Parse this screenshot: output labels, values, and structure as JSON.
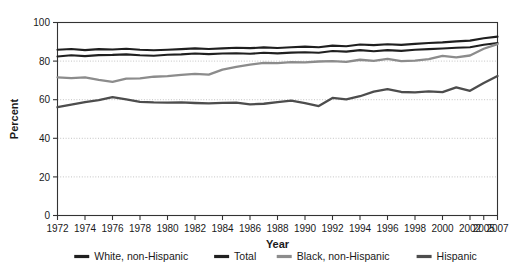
{
  "chart_data": {
    "type": "line",
    "title": "",
    "xlabel": "Year",
    "ylabel": "Percent",
    "ylim": [
      0,
      100
    ],
    "ytick_values": [
      0,
      20,
      40,
      60,
      80,
      100
    ],
    "ytick_labels": [
      "0",
      "20",
      "40",
      "60",
      "80",
      "100"
    ],
    "grid": "horizontal-dotted",
    "legend_position": "bottom",
    "x": [
      1972,
      1973,
      1974,
      1975,
      1976,
      1977,
      1978,
      1979,
      1980,
      1981,
      1982,
      1983,
      1984,
      1985,
      1986,
      1987,
      1988,
      1989,
      1990,
      1991,
      1992,
      1993,
      1994,
      1995,
      1996,
      1997,
      1998,
      1999,
      2000,
      2001,
      2002,
      2005,
      2007
    ],
    "xtick_labels": [
      "1972",
      "1974",
      "1976",
      "1978",
      "1980",
      "1982",
      "1984",
      "1986",
      "1988",
      "1990",
      "1992",
      "1994",
      "1996",
      "1998",
      "2000",
      "2002",
      "2005",
      "2007"
    ],
    "xtick_values": [
      1972,
      1974,
      1976,
      1978,
      1980,
      1982,
      1984,
      1986,
      1988,
      1990,
      1992,
      1994,
      1996,
      1998,
      2000,
      2002,
      2005,
      2007
    ],
    "series": [
      {
        "name": "White, non-Hispanic",
        "color": "#1f1f1f",
        "width": 2.1,
        "values": [
          85.9,
          86.3,
          85.7,
          86.2,
          86.0,
          86.4,
          85.9,
          85.6,
          85.9,
          86.2,
          86.6,
          86.3,
          86.6,
          86.9,
          86.7,
          87.1,
          86.8,
          87.2,
          87.5,
          87.2,
          88.0,
          87.7,
          88.6,
          88.3,
          88.7,
          88.4,
          88.9,
          89.4,
          89.7,
          90.2,
          90.6,
          91.8,
          92.7
        ]
      },
      {
        "name": "Total",
        "color": "#202020",
        "width": 2.1,
        "values": [
          82.4,
          83.0,
          82.6,
          83.1,
          83.2,
          83.5,
          83.0,
          82.8,
          83.3,
          83.5,
          83.9,
          83.6,
          83.9,
          84.1,
          83.8,
          84.3,
          84.0,
          84.4,
          84.6,
          84.3,
          85.2,
          84.9,
          85.7,
          85.1,
          85.7,
          85.3,
          85.9,
          86.2,
          86.5,
          86.9,
          87.2,
          88.5,
          89.4
        ]
      },
      {
        "name": "Black, non-Hispanic",
        "color": "#8c8c8c",
        "width": 2.3,
        "values": [
          71.6,
          71.2,
          71.6,
          70.3,
          69.2,
          70.9,
          71.1,
          71.9,
          72.2,
          72.9,
          73.4,
          73.0,
          75.6,
          77.0,
          78.2,
          79.1,
          79.0,
          79.5,
          79.3,
          79.8,
          80.0,
          79.6,
          80.7,
          80.1,
          81.1,
          80.0,
          80.2,
          81.0,
          82.7,
          81.9,
          82.9,
          86.4,
          88.8
        ]
      },
      {
        "name": "Hispanic",
        "color": "#4d4d4d",
        "width": 2.3,
        "values": [
          56.1,
          57.4,
          58.8,
          59.8,
          61.3,
          60.2,
          58.9,
          58.6,
          58.5,
          58.6,
          58.3,
          58.1,
          58.4,
          58.5,
          57.6,
          57.9,
          58.8,
          59.5,
          58.2,
          56.7,
          60.9,
          60.2,
          61.8,
          64.2,
          65.5,
          64.0,
          63.8,
          64.3,
          63.9,
          66.4,
          64.6,
          68.6,
          72.3
        ]
      }
    ]
  },
  "legend": {
    "items": [
      {
        "label": "White, non-Hispanic",
        "color": "#1f1f1f"
      },
      {
        "label": "Total",
        "color": "#202020"
      },
      {
        "label": "Black, non-Hispanic",
        "color": "#8c8c8c"
      },
      {
        "label": "Hispanic",
        "color": "#4d4d4d"
      }
    ]
  },
  "colors": {
    "axis": "#333333",
    "grid": "#b4b4b4",
    "text": "#1a1a1a",
    "background": "#ffffff"
  }
}
